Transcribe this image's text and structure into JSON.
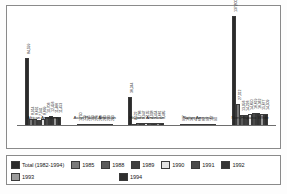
{
  "chart_data": {
    "type": "bar",
    "title": "",
    "xlabel": "",
    "ylabel": "",
    "grid": false,
    "legend_position": "bottom",
    "ylim": [
      0,
      137800
    ],
    "categories": [
      "African American",
      "Asian Pacific American",
      "Hispanic American",
      "Native American",
      "Non-Hispanic White"
    ],
    "series": [
      {
        "name": "Total (1982-1994)",
        "color": "#2b2b2b",
        "values": [
          84599,
          1750,
          36244,
          937,
          137800
        ]
      },
      {
        "name": "1985",
        "color": "#7a7a7a",
        "values": [
          8914,
          139,
          2522,
          16,
          27012
        ]
      },
      {
        "name": "1988",
        "color": "#5a5a5a",
        "values": [
          8691,
          205,
          3786,
          36,
          13956
        ]
      },
      {
        "name": "1989",
        "color": "#3f3f3f",
        "values": [
          7941,
          193,
          3947,
          40,
          14226
        ]
      },
      {
        "name": "1990",
        "color": "#e2e2e2",
        "values": [
          8899,
          226,
          4105,
          66,
          14650
        ]
      },
      {
        "name": "1991",
        "color": "#4a4a4a",
        "values": [
          10706,
          268,
          4008,
          87,
          16619
        ]
      },
      {
        "name": "1992",
        "color": "#343434",
        "values": [
          12456,
          283,
          3454,
          93,
          16362
        ]
      },
      {
        "name": "1993",
        "color": "#9a9a9a",
        "values": [
          11466,
          293,
          3661,
          117,
          15677
        ]
      },
      {
        "name": "1994",
        "color": "#2e2e2e",
        "values": [
          11453,
          293,
          3485,
          90,
          14509
        ]
      }
    ],
    "bar_labels": [
      [
        "84,599",
        "8,914",
        "8,691",
        "7,941",
        "8,899",
        "10,706",
        "12,456",
        "11,466",
        "11,453"
      ],
      [
        "1,750",
        "139",
        "205",
        "193",
        "226",
        "268",
        "283",
        "293",
        "293"
      ],
      [
        "36,244",
        "2,522",
        "3,786",
        "3,947",
        "4,105",
        "4,008",
        "3,454",
        "3,661",
        "3,485"
      ],
      [
        "937",
        "16",
        "36",
        "40",
        "66",
        "87",
        "93",
        "117",
        "90"
      ],
      [
        "137,800",
        "27,012",
        "13,956",
        "14,226",
        "14,650",
        "16,619",
        "16,362",
        "15,677",
        "14,509"
      ]
    ]
  },
  "legend": {
    "row1": [
      {
        "label": "Total (1982-1994)",
        "color": "#2b2b2b"
      },
      {
        "label": "1985",
        "color": "#7a7a7a"
      },
      {
        "label": "1988",
        "color": "#5a5a5a"
      },
      {
        "label": "1989",
        "color": "#3f3f3f"
      },
      {
        "label": "1990",
        "color": "#e2e2e2"
      },
      {
        "label": "1991",
        "color": "#4a4a4a"
      },
      {
        "label": "1992",
        "color": "#343434"
      }
    ],
    "row2": [
      {
        "label": "1993",
        "color": "#9a9a9a"
      },
      {
        "label": "1994",
        "color": "#2e2e2e"
      }
    ]
  }
}
